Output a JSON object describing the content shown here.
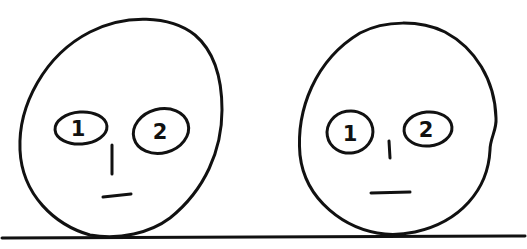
{
  "diagram": {
    "stroke_color": "#111111",
    "background": "#ffffff",
    "faces": [
      {
        "name": "left-face",
        "eyes": [
          {
            "label": "1"
          },
          {
            "label": "2"
          }
        ]
      },
      {
        "name": "right-face",
        "eyes": [
          {
            "label": "1"
          },
          {
            "label": "2"
          }
        ]
      }
    ]
  }
}
